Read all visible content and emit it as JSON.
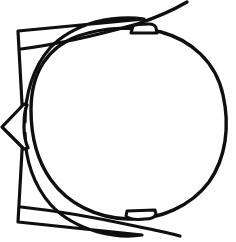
{
  "image": {
    "title": "Black and white line drawing of a fish-like creature seen from above",
    "width": 236,
    "height": 242,
    "background_color": "#ffffff",
    "ink_color": "#100f0f",
    "style": "hand-drawn ink outline, no fill, no text labels"
  },
  "palette": {
    "background": "#ffffff",
    "ink": "#100f0f",
    "shape_fill": "#ffffff"
  },
  "shapes": {
    "body": {
      "name": "oval-body",
      "description": "large egg shaped outline occupying the center and right of the frame",
      "center_x": 128,
      "center_y": 124,
      "radius_x": 97,
      "radius_y": 92,
      "stroke_width": 3.4
    },
    "top_fin": {
      "name": "upper-left-fin",
      "description": "triangular wing with concave trailing edge at the upper left",
      "tip_x": 18,
      "tip_y": 31,
      "stroke_width": 3.2
    },
    "bottom_fin": {
      "name": "lower-left-fin",
      "description": "triangular wing with concave trailing edge at the lower left",
      "tip_x": 18,
      "tip_y": 222,
      "stroke_width": 3.2
    },
    "left_spike": {
      "name": "left-beak-spike",
      "description": "pointed arrow shaped snout projecting left at mid height",
      "tip_x": 2,
      "tip_y": 127,
      "stroke_width": 3.2
    },
    "top_tab": {
      "name": "upper-tab",
      "description": "small trapezoidal tab sitting on the top edge of the body",
      "x": 130,
      "y": 24,
      "width": 26,
      "height": 9,
      "stroke_width": 3.0
    },
    "bottom_tab": {
      "name": "lower-tab",
      "description": "small trapezoidal tab hanging under the bottom edge of the body",
      "x": 126,
      "y": 210,
      "width": 29,
      "height": 9,
      "stroke_width": 3.0
    },
    "top_whisker": {
      "name": "upper-whisker-line",
      "description": "long straight line crossing the upper tab and exiting the top right corner",
      "from_x": 22,
      "from_y": 49,
      "to_x": 187,
      "to_y": 2,
      "stroke_width": 3.2
    },
    "bottom_whisker": {
      "name": "lower-whisker-line",
      "description": "long straight line crossing the lower tab and exiting the bottom right corner",
      "from_x": 22,
      "from_y": 207,
      "to_x": 180,
      "to_y": 236,
      "stroke_width": 3.2
    }
  },
  "geometry": {
    "body_path": "M 31 110 C 31 72 48 47 78 36 C 104 27 136 26 161 32 C 191 40 216 62 223 95 C 230 126 226 158 209 182 C 191 206 160 220 128 219 C 97 218 68 204 51 180 C 36 159 31 134 31 110 Z",
    "top_fin_path": "M 18 31 L 23 122 L 25 122 C 25 95 33 67 50 48 C 62 35 78 27 95 22 C 112 18 130 17 144 19 Z",
    "bottom_fin_path": "M 18 222 L 23 133 L 25 133 C 25 160 34 186 51 205 C 64 219 80 227 98 232 C 113 236 129 237 142 235 Z",
    "left_spike_path": "M 24 104 L 2 127 L 24 149 L 28 148 C 25 141 24 134 24 127 C 24 119 24 111 27 105 Z",
    "top_tab_path": "M 131 33 L 133 26 C 136 24 142 24 149 24 C 153 24 156 26 156 28 L 157 33 Z",
    "bottom_tab_path": "M 127 211 L 126 216 C 129 219 136 220 145 219 C 151 219 155 217 156 214 L 155 210 Z",
    "top_whisker_path": "M 21 49 C 60 44 105 33 137 24 C 158 17 175 9 187 2",
    "bottom_whisker_path": "M 21 207 C 58 211 103 219 135 226 C 155 230 170 233 180 236"
  },
  "counts": {
    "closed_shapes": 6,
    "open_lines": 2,
    "total_strokes": 8
  }
}
